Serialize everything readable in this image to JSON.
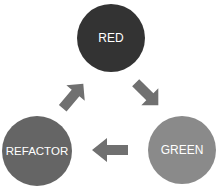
{
  "diagram": {
    "type": "cycle",
    "nodes": [
      {
        "id": "red",
        "label": "RED",
        "color": "#333333",
        "cx": 111,
        "cy": 38,
        "r": 34
      },
      {
        "id": "green",
        "label": "GREEN",
        "color": "#8a8a8a",
        "cx": 182,
        "cy": 150,
        "r": 34
      },
      {
        "id": "refactor",
        "label": "REFACTOR",
        "color": "#656565",
        "cx": 37,
        "cy": 151,
        "r": 35
      }
    ],
    "edges": [
      {
        "from": "RED",
        "to": "GREEN"
      },
      {
        "from": "GREEN",
        "to": "REFACTOR"
      },
      {
        "from": "REFACTOR",
        "to": "RED"
      }
    ],
    "arrow_color": "#707070"
  }
}
